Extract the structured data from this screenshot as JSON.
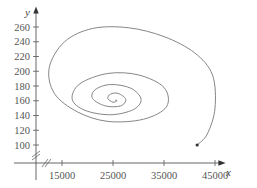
{
  "chart_data": {
    "type": "line",
    "title": "",
    "xlabel": "x",
    "ylabel": "y",
    "xlim": [
      10000,
      49000
    ],
    "ylim": [
      80,
      270
    ],
    "x_ticks": [
      15000,
      25000,
      35000,
      45000
    ],
    "y_ticks": [
      100,
      120,
      140,
      160,
      180,
      200,
      220,
      240,
      260
    ],
    "x_tick_labels": [
      "15000",
      "25000",
      "35000",
      "45000"
    ],
    "y_tick_labels": [
      "100",
      "120",
      "140",
      "160",
      "180",
      "200",
      "220",
      "240",
      "260"
    ],
    "axis_breaks": true,
    "grid": false,
    "legend": null,
    "series": [
      {
        "name": "phase trajectory",
        "description": "Spiral trajectory starting at (41500, 100) and spiraling inward counterclockwise toward equilibrium near (25400, 161)",
        "start_point": {
          "x": 41500,
          "y": 100
        },
        "equilibrium": {
          "x": 25400,
          "y": 161
        },
        "x": [
          41500,
          43500,
          45000,
          44500,
          41000,
          35000,
          28000,
          21000,
          15500,
          12500,
          13500,
          18000,
          24000,
          31000,
          35500,
          35000,
          30000,
          24000,
          18500,
          17000,
          19500,
          24500,
          29000,
          30500,
          28500,
          24500,
          21500,
          21000,
          23500,
          26500,
          27500,
          26000,
          24500,
          24000,
          25000,
          25800,
          25400
        ],
        "y": [
          100,
          115,
          150,
          195,
          225,
          247,
          259,
          258,
          240,
          205,
          170,
          145,
          132,
          135,
          152,
          178,
          195,
          197,
          183,
          162,
          147,
          141,
          148,
          162,
          177,
          182,
          175,
          163,
          153,
          153,
          162,
          170,
          169,
          163,
          158,
          160,
          161
        ]
      }
    ]
  }
}
